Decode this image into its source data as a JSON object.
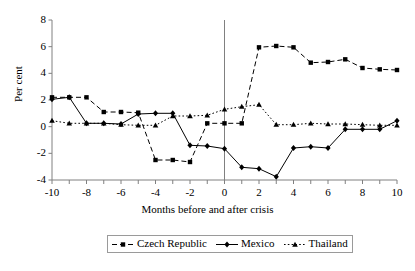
{
  "chart_data": {
    "type": "line",
    "title": "",
    "xlabel": "Months before and after crisis",
    "ylabel": "Per cent",
    "xlim": [
      -10,
      10
    ],
    "ylim": [
      -4,
      8
    ],
    "ytick_values": [
      -4,
      -2,
      0,
      2,
      4,
      6,
      8
    ],
    "ytick_labels": [
      "-4",
      "-2",
      "0",
      "2",
      "4",
      "6",
      "8"
    ],
    "xtick_values": [
      -10,
      -9,
      -8,
      -7,
      -6,
      -5,
      -4,
      -3,
      -2,
      -1,
      0,
      1,
      2,
      3,
      4,
      5,
      6,
      7,
      8,
      9,
      10
    ],
    "xtick_labels_values": [
      -10,
      -8,
      -6,
      -4,
      -2,
      0,
      2,
      4,
      6,
      8,
      10
    ],
    "xtick_labels": [
      "-10",
      "-8",
      "-6",
      "-4",
      "-2",
      "0",
      "2",
      "4",
      "6",
      "8",
      "10"
    ],
    "grid": false,
    "legend_position": "bottom",
    "annotations": [
      {
        "name": "crisis-line",
        "type": "vline",
        "x": 0,
        "label": ""
      }
    ],
    "x": [
      -10,
      -9,
      -8,
      -7,
      -6,
      -5,
      -4,
      -3,
      -2,
      -1,
      0,
      1,
      2,
      3,
      4,
      5,
      6,
      7,
      8,
      9,
      10
    ],
    "series": [
      {
        "name": "Czech Republic",
        "marker": "square",
        "linestyle": "dashed",
        "color": "#000000",
        "values": [
          2.2,
          2.2,
          2.2,
          1.1,
          1.1,
          1.05,
          -2.5,
          -2.5,
          -2.65,
          0.25,
          0.25,
          0.25,
          5.95,
          6.05,
          5.95,
          4.8,
          4.85,
          5.05,
          4.4,
          4.3,
          4.25
        ]
      },
      {
        "name": "Mexico",
        "marker": "diamond",
        "linestyle": "solid",
        "color": "#000000",
        "values": [
          2.05,
          2.2,
          0.25,
          0.25,
          0.2,
          0.95,
          1.0,
          1.0,
          -1.4,
          -1.45,
          -1.65,
          -3.05,
          -3.15,
          -3.75,
          -1.6,
          -1.5,
          -1.6,
          -0.2,
          -0.2,
          -0.2,
          0.45
        ]
      },
      {
        "name": "Thailand",
        "marker": "triangle",
        "linestyle": "dotted",
        "color": "#000000",
        "values": [
          0.45,
          0.25,
          0.25,
          0.25,
          0.15,
          0.1,
          0.1,
          0.8,
          0.8,
          0.85,
          1.3,
          1.5,
          1.65,
          0.15,
          0.15,
          0.25,
          0.2,
          0.2,
          0.15,
          0.1,
          0.1
        ]
      }
    ]
  },
  "legend": {
    "items": [
      {
        "label": "Czech Republic"
      },
      {
        "label": "Mexico"
      },
      {
        "label": "Thailand"
      }
    ]
  }
}
